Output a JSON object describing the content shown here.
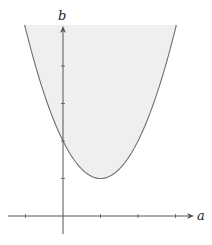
{
  "diagram": {
    "title": "",
    "axes": {
      "x_label": "a",
      "y_label": "b",
      "origin_px": [
        63,
        216
      ],
      "unit_px": 37.5,
      "x_ticks": [
        -1,
        1,
        2,
        3
      ],
      "y_ticks": [
        1,
        2,
        3,
        4
      ]
    },
    "curve": {
      "equation": "b = (a - 1)^2 + 1",
      "vertex": [
        1,
        1
      ],
      "y_intercept": 2,
      "stroke": "#707070"
    },
    "region": {
      "fill": "#efefef",
      "label": "shaded region above curve"
    },
    "colors": {
      "axis": "#555555",
      "background": "#ffffff"
    }
  },
  "chart_data": {
    "type": "area",
    "title": "",
    "xlabel": "a",
    "ylabel": "b",
    "function": "b = (a-1)^2 + 1",
    "x": [
      -1.05,
      -0.5,
      0,
      0.5,
      1,
      1.5,
      2,
      2.5,
      3.05
    ],
    "values": [
      5.2,
      3.25,
      2,
      1.25,
      1,
      1.25,
      2,
      3.25,
      5.2
    ],
    "xlim": [
      -1.5,
      3.5
    ],
    "ylim": [
      -0.5,
      5.1
    ],
    "x_ticks": [
      -1,
      1,
      2,
      3
    ],
    "y_ticks": [
      1,
      2,
      3,
      4
    ],
    "grid": false,
    "fill": "above curve"
  }
}
